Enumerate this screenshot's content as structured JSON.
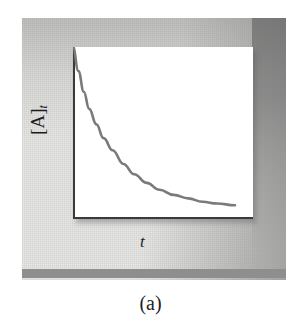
{
  "figure": {
    "caption": "(a)",
    "panel_bg_color": "#e8e8e6",
    "band_color": "#8e8e8e",
    "plot_bg_color": "#ffffff",
    "axis_color": "#3a3a3a",
    "curve_color": "#7a7a7a"
  },
  "axes": {
    "ylabel_main": "[A]",
    "ylabel_sub": "t",
    "xlabel": "t"
  },
  "chart_data": {
    "type": "line",
    "title": "(a)",
    "xlabel": "t",
    "ylabel": "[A]t",
    "grid": false,
    "legend": null,
    "axis_ticks": false,
    "xlim": [
      0,
      1
    ],
    "ylim": [
      0,
      1
    ],
    "series": [
      {
        "name": "[A]t vs t",
        "color": "#7a7a7a",
        "x": [
          0.0,
          0.03,
          0.06,
          0.09,
          0.13,
          0.17,
          0.22,
          0.28,
          0.34,
          0.41,
          0.48,
          0.56,
          0.64,
          0.72,
          0.8,
          0.9
        ],
        "y": [
          1.0,
          0.86,
          0.74,
          0.64,
          0.55,
          0.47,
          0.4,
          0.32,
          0.26,
          0.21,
          0.17,
          0.14,
          0.12,
          0.1,
          0.09,
          0.08
        ]
      }
    ]
  }
}
